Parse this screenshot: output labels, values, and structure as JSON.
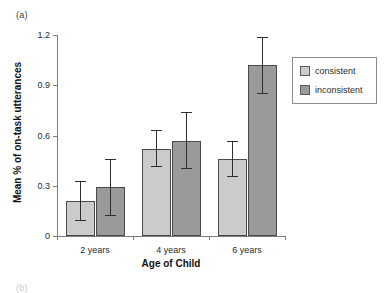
{
  "figure": {
    "panel_label_a": "(a)",
    "panel_label_b": "(b)"
  },
  "legend": {
    "position": "right",
    "entries": [
      {
        "label": "consistent",
        "color": "#cbcbcb"
      },
      {
        "label": "inconsistent",
        "color": "#9a9a9a"
      }
    ]
  },
  "chart_data": {
    "type": "bar",
    "title": "",
    "xlabel": "Age of Child",
    "ylabel": "Mean % of on-task utterances",
    "categories": [
      "2 years",
      "4 years",
      "6 years"
    ],
    "ylim": [
      0,
      1.2
    ],
    "yticks": [
      0,
      0.3,
      0.6,
      0.9,
      1.2
    ],
    "ytick_labels": [
      "0",
      "0.3",
      "0.6",
      "0.9",
      "1.2"
    ],
    "grid": false,
    "legend_position": "right",
    "series": [
      {
        "name": "consistent",
        "color": "#cbcbcb",
        "values": [
          0.21,
          0.52,
          0.46
        ],
        "errors": [
          0.12,
          0.11,
          0.11
        ]
      },
      {
        "name": "inconsistent",
        "color": "#9a9a9a",
        "values": [
          0.29,
          0.57,
          1.02
        ],
        "errors": [
          0.17,
          0.17,
          0.17
        ]
      }
    ]
  }
}
